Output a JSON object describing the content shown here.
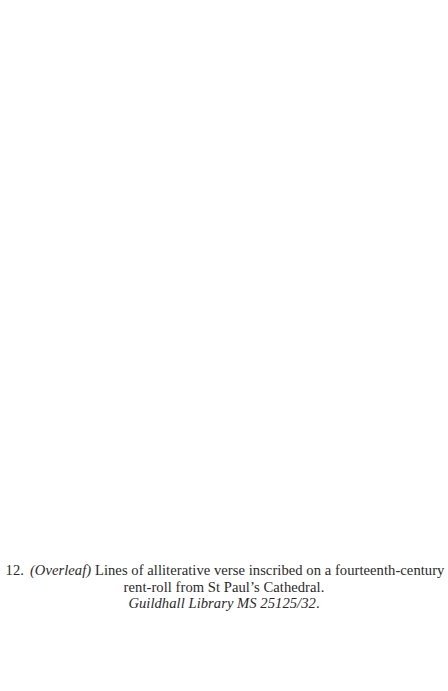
{
  "caption": {
    "number": "12.",
    "overleaf_label": "(Overleaf)",
    "line1_text": " Lines of alliterative verse inscribed on a fourteenth-century",
    "line2_text": "rent-roll from St Paul’s Cathedral.",
    "line3_source": "Guildhall Library MS 25125/32",
    "line3_period": "."
  }
}
